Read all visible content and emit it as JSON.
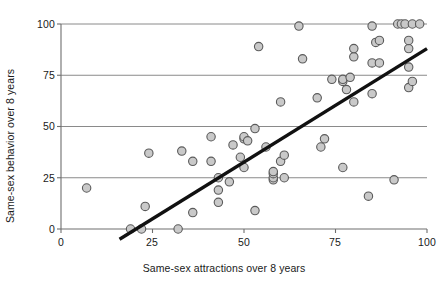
{
  "chart_data": {
    "type": "scatter",
    "title": "",
    "xlabel": "Same-sex attractions over 8 years",
    "ylabel": "Same-sex behavior over 8 years",
    "xlim": [
      0,
      100
    ],
    "ylim": [
      0,
      100
    ],
    "xticks": [
      0,
      25,
      50,
      75,
      100
    ],
    "yticks": [
      0,
      25,
      50,
      75,
      100
    ],
    "xtick_labels": [
      "0",
      "25",
      "50",
      "75",
      "100"
    ],
    "ytick_labels": [
      "0",
      "25",
      "50",
      "75",
      "100"
    ],
    "grid": "horizontal",
    "legend": "none",
    "marker": {
      "shape": "circle",
      "fill": "#c9c9c9",
      "stroke": "#5a5a5a",
      "radius_px": 4.2
    },
    "points": [
      [
        7,
        20
      ],
      [
        19,
        0
      ],
      [
        22,
        0
      ],
      [
        23,
        11
      ],
      [
        24,
        37
      ],
      [
        32,
        0
      ],
      [
        33,
        38
      ],
      [
        36,
        8
      ],
      [
        36,
        33
      ],
      [
        41,
        33
      ],
      [
        41,
        45
      ],
      [
        43,
        13
      ],
      [
        43,
        19
      ],
      [
        43,
        25
      ],
      [
        46,
        23
      ],
      [
        47,
        41
      ],
      [
        49,
        35
      ],
      [
        50,
        30
      ],
      [
        50,
        44
      ],
      [
        50,
        45
      ],
      [
        51,
        43
      ],
      [
        53,
        9
      ],
      [
        53,
        49
      ],
      [
        54,
        89
      ],
      [
        56,
        40
      ],
      [
        58,
        24
      ],
      [
        58,
        25
      ],
      [
        58,
        27
      ],
      [
        58,
        28
      ],
      [
        60,
        33
      ],
      [
        60,
        62
      ],
      [
        61,
        25
      ],
      [
        61,
        36
      ],
      [
        65,
        99
      ],
      [
        66,
        83
      ],
      [
        70,
        64
      ],
      [
        71,
        40
      ],
      [
        72,
        44
      ],
      [
        74,
        73
      ],
      [
        77,
        30
      ],
      [
        77,
        72
      ],
      [
        77,
        73
      ],
      [
        78,
        68
      ],
      [
        79,
        74
      ],
      [
        80,
        62
      ],
      [
        80,
        84
      ],
      [
        80,
        88
      ],
      [
        84,
        16
      ],
      [
        85,
        66
      ],
      [
        85,
        81
      ],
      [
        85,
        99
      ],
      [
        86,
        91
      ],
      [
        87,
        92
      ],
      [
        87,
        81
      ],
      [
        91,
        24
      ],
      [
        92,
        100
      ],
      [
        93,
        100
      ],
      [
        94,
        100
      ],
      [
        95,
        69
      ],
      [
        95,
        79
      ],
      [
        95,
        88
      ],
      [
        95,
        92
      ],
      [
        96,
        72
      ],
      [
        96,
        100
      ],
      [
        98,
        100
      ]
    ],
    "trendline": {
      "x_start": 16,
      "y_start": -5,
      "x_end": 100,
      "y_end": 88,
      "color": "#111111",
      "width_px": 3.4
    },
    "axis_color": "#6e6e6e",
    "grid_color": "#8a8a8a"
  }
}
